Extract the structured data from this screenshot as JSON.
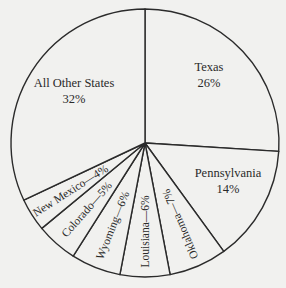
{
  "chart_data": {
    "type": "pie",
    "title": "",
    "start_angle_deg": 0,
    "direction": "clockwise",
    "slices": [
      {
        "label": "Texas",
        "value": 26,
        "display": "26%",
        "label_style": "inside-horizontal"
      },
      {
        "label": "Pennsylvania",
        "value": 14,
        "display": "14%",
        "label_style": "inside-horizontal"
      },
      {
        "label": "Oklahoma",
        "value": 7,
        "display": "Oklahoma—7%",
        "label_style": "radial"
      },
      {
        "label": "Louisiana",
        "value": 6,
        "display": "Louisiana—6%",
        "label_style": "radial"
      },
      {
        "label": "Wyoming",
        "value": 6,
        "display": "Wyoming—6%",
        "label_style": "radial"
      },
      {
        "label": "Colorado",
        "value": 5,
        "display": "Colorado—5%",
        "label_style": "radial"
      },
      {
        "label": "New Mexico",
        "value": 4,
        "display": "New Mexico—4%",
        "label_style": "radial"
      },
      {
        "label": "All Other States",
        "value": 32,
        "display": "32%",
        "label_style": "inside-horizontal"
      }
    ],
    "colors": {
      "fill": "#f1f1ef",
      "stroke": "#2b2b2b",
      "text": "#2a2a2a"
    }
  }
}
